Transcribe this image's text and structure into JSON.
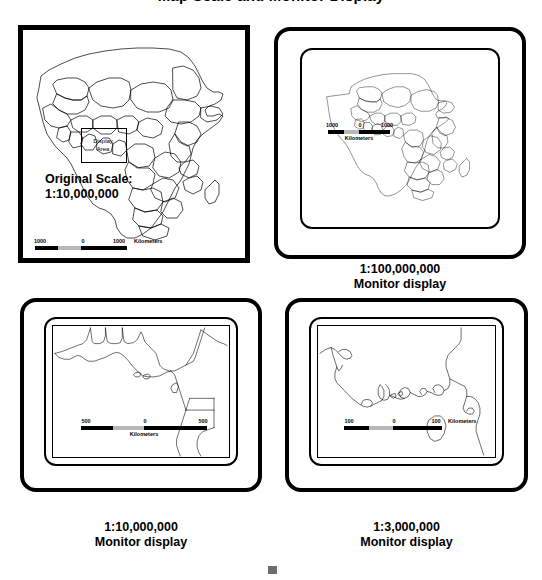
{
  "figure": {
    "title": "Map Scale and Monitor Display"
  },
  "panels": [
    {
      "id": "original-map",
      "kind": "paper-map",
      "original_scale_label": "Original Scale:",
      "original_scale_value": "1:10,000,000",
      "display_area_label_line1": "Display",
      "display_area_label_line2": "Area",
      "scalebar": {
        "left": "1000",
        "center": "0",
        "right": "1000",
        "unit": "Kilometers",
        "layout": "inline"
      },
      "map_subject": "Africa continent with country borders"
    },
    {
      "id": "monitor-1-100000000",
      "kind": "monitor",
      "caption_line1": "1:100,000,000",
      "caption_line2": "Monitor display",
      "scalebar": {
        "left": "1000",
        "center": "0",
        "right": "1000",
        "unit": "Kilometers",
        "layout": "stacked"
      },
      "map_subject": "Africa continent with country borders"
    },
    {
      "id": "monitor-1-10000000",
      "kind": "monitor",
      "caption_line1": "1:10,000,000",
      "caption_line2": "Monitor display",
      "scalebar": {
        "left": "500",
        "center": "0",
        "right": "500",
        "unit": "Kilometers",
        "layout": "stacked"
      },
      "map_subject": "Gulf of Guinea coastline, West Africa"
    },
    {
      "id": "monitor-1-3000000",
      "kind": "monitor",
      "caption_line1": "1:3,000,000",
      "caption_line2": "Monitor display",
      "scalebar": {
        "left": "100",
        "center": "0",
        "right": "100",
        "unit": "Kilometers",
        "layout": "inline"
      },
      "map_subject": "Niger Delta coastline detail"
    }
  ],
  "colors": {
    "ink": "#000000",
    "page": "#ffffff",
    "scalebar_light": "#b8b8b8",
    "artifact_gray": "#6e6e6e"
  }
}
